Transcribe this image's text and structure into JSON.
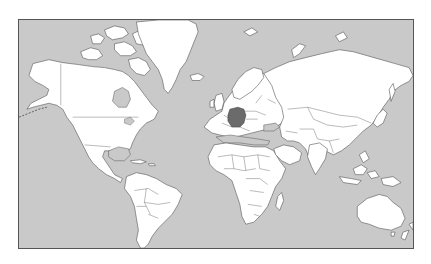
{
  "map": {
    "projection": "mercator",
    "view": "world",
    "highlighted_country": "Germany",
    "colors": {
      "ocean": "#c9c9c9",
      "land": "#ffffff",
      "border": "#555555",
      "highlight": "#6b6b6b",
      "frame_background": "#ffffff"
    },
    "labels": []
  }
}
